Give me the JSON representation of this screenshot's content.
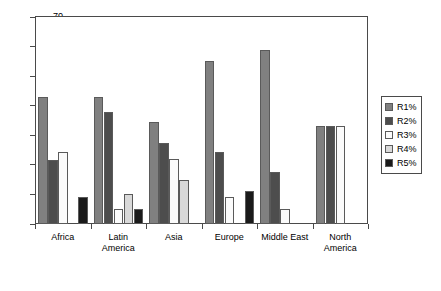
{
  "chart_data": {
    "type": "bar",
    "title": "",
    "subtitle": "",
    "xlabel": "",
    "ylabel": "",
    "ylim": [
      0,
      70
    ],
    "ytick_values": [
      0,
      10,
      20,
      30,
      40,
      50,
      60,
      70
    ],
    "ytick_labels": [
      "0",
      "10",
      "20",
      "30",
      "40",
      "50",
      "60",
      "70"
    ],
    "grid": false,
    "legend_position": "right",
    "categories": [
      "Africa",
      "Latin America",
      "Asia",
      "Europe",
      "Middle East",
      "North America"
    ],
    "category_lines": [
      [
        "Africa"
      ],
      [
        "Latin",
        "America"
      ],
      [
        "Asia"
      ],
      [
        "Europe"
      ],
      [
        "Middle East"
      ],
      [
        "North",
        "America"
      ]
    ],
    "series": [
      {
        "name": "R1%",
        "color": "#808080",
        "values": [
          43,
          43,
          34.5,
          55,
          59,
          33
        ]
      },
      {
        "name": "R2%",
        "color": "#4d4d4d",
        "values": [
          21.5,
          38,
          27.5,
          24.5,
          17.5,
          33
        ]
      },
      {
        "name": "R3%",
        "color": "#fbfbfb",
        "values": [
          24.5,
          5,
          22,
          9,
          5,
          33
        ]
      },
      {
        "name": "R4%",
        "color": "#d9d9d9",
        "values": [
          0,
          10,
          15,
          0,
          0,
          0
        ]
      },
      {
        "name": "R5%",
        "color": "#1a1a1a",
        "values": [
          9,
          5,
          0,
          11,
          0,
          0
        ]
      }
    ]
  }
}
